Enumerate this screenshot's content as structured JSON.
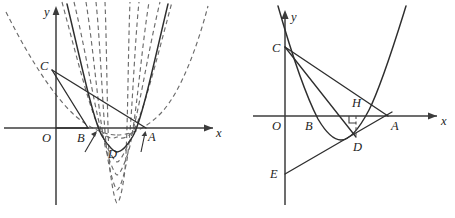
{
  "figure": {
    "background_color": "#ffffff",
    "stroke_color": "#2e2e2e",
    "dashed_color": "#6b6b6b",
    "width": 455,
    "height": 218
  },
  "left_diagram": {
    "name": "left-parabola-family-diagram",
    "axis": {
      "x_label": "x",
      "y_label": "y",
      "origin_label": "O"
    },
    "points": [
      {
        "id": "O",
        "label": "O",
        "x": 53,
        "y": 128
      },
      {
        "id": "B",
        "label": "B",
        "x": 88,
        "y": 128
      },
      {
        "id": "A",
        "label": "A",
        "x": 146,
        "y": 128
      },
      {
        "id": "C",
        "label": "C",
        "x": 52,
        "y": 70
      },
      {
        "id": "D",
        "label": "D",
        "x": 112,
        "y": 150
      }
    ],
    "segments": [
      {
        "id": "CA",
        "from": "C",
        "to": "A"
      },
      {
        "id": "CB",
        "from": "C",
        "to": "B"
      },
      {
        "id": "OB",
        "from": "O",
        "to": "B"
      },
      {
        "id": "BA",
        "from": "B",
        "to": "A"
      }
    ],
    "solid_curve": {
      "id": "parabola-solid",
      "description": "solid parabola through A and B with vertex near D",
      "vertex_x": 117,
      "vertex_y": 152
    },
    "dashed_curves": [
      {
        "id": "parabola-dashed-1",
        "vertex_x": 117,
        "vertex_y": 137
      },
      {
        "id": "parabola-dashed-2",
        "vertex_x": 117,
        "vertex_y": 162
      },
      {
        "id": "parabola-dashed-3",
        "vertex_x": 117,
        "vertex_y": 175
      },
      {
        "id": "parabola-dashed-4",
        "vertex_x": 117,
        "vertex_y": 190
      },
      {
        "id": "parabola-dashed-5",
        "vertex_x": 117,
        "vertex_y": 203
      }
    ]
  },
  "right_diagram": {
    "name": "right-parabola-diagram",
    "axis": {
      "x_label": "x",
      "y_label": "y",
      "origin_label": "O"
    },
    "points": [
      {
        "id": "O",
        "label": "O",
        "x": 285,
        "y": 116
      },
      {
        "id": "B",
        "label": "B",
        "x": 313,
        "y": 116
      },
      {
        "id": "A",
        "label": "A",
        "x": 388,
        "y": 116
      },
      {
        "id": "C",
        "label": "C",
        "x": 285,
        "y": 47
      },
      {
        "id": "D",
        "label": "D",
        "x": 356,
        "y": 137
      },
      {
        "id": "E",
        "label": "E",
        "x": 285,
        "y": 174
      },
      {
        "id": "H",
        "label": "H",
        "x": 356,
        "y": 116
      }
    ],
    "segments": [
      {
        "id": "CA",
        "from": "C",
        "to": "A"
      },
      {
        "id": "CD",
        "from": "C",
        "to": "D"
      },
      {
        "id": "EA",
        "from": "E",
        "to": "A"
      },
      {
        "id": "HD",
        "from": "H",
        "to": "D",
        "style": "dashed"
      }
    ],
    "right_angle_marker": {
      "at": "H",
      "label": "right-angle"
    },
    "solid_curve": {
      "id": "parabola-solid-right",
      "description": "solid parabola through B and A, opening upward",
      "vertex_x": 341,
      "vertex_y": 140
    }
  }
}
